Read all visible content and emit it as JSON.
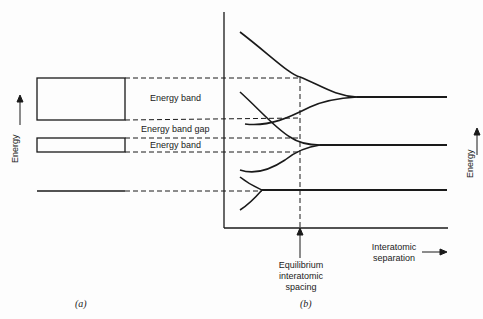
{
  "panel_a": {
    "label": "(a)",
    "y_axis_label": "Energy",
    "band_labels": [
      "Energy band",
      "Energy band gap",
      "Energy band"
    ]
  },
  "panel_b": {
    "label": "(b)",
    "y_axis_label": "Energy",
    "x_axis_label_line1": "Interatomic",
    "x_axis_label_line2": "separation",
    "annotation_line1": "Equilibrium",
    "annotation_line2": "interatomic",
    "annotation_line3": "spacing"
  },
  "colors": {
    "line": "#1a1a1a",
    "background": "#fdfdfd"
  }
}
